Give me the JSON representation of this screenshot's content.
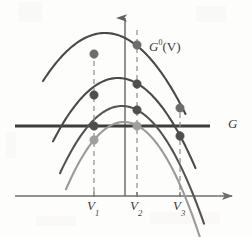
{
  "figure": {
    "background_color": "#fdfdfc",
    "width": 252,
    "height": 237
  },
  "labels": {
    "curve_family": {
      "base": "G",
      "superscript": "0",
      "argument": "(V)",
      "full_text": "G⁰(V)",
      "x": 149,
      "y": 40
    },
    "horizontal_line": {
      "text": "G",
      "x": 228,
      "y": 117
    },
    "v1": {
      "base": "V",
      "subscript": "1",
      "full_text": "V₁",
      "x": 87,
      "y": 199
    },
    "v2": {
      "base": "V",
      "subscript": "2",
      "full_text": "V₂",
      "x": 130,
      "y": 199
    },
    "v3": {
      "base": "V",
      "subscript": "3",
      "full_text": "V₃",
      "x": 173,
      "y": 199
    }
  },
  "colors": {
    "curve_dark": "#4a4a4a",
    "curve_mid": "#545454",
    "curve_light": "#9a9a9a",
    "axis": "#6e6e6e",
    "g_line": "#3d3d3d",
    "dashed": "#8d8d8d",
    "dot_dark": "#5a5a5a",
    "dot_light": "#9f9f9f",
    "text": "#3a3a3a"
  },
  "chart_data": {
    "type": "line",
    "title": "",
    "subtitle": "",
    "xlabel": "",
    "ylabel": "",
    "grid": false,
    "legend_position": "none",
    "xlim": [
      0,
      252
    ],
    "ylim": [
      237,
      0
    ],
    "axes": {
      "vertical_axis": {
        "x": 125,
        "y_top": 18,
        "y_bottom": 196,
        "arrow": "up"
      },
      "horizontal_axis": {
        "y": 196,
        "x_left": 15,
        "x_right": 232,
        "arrow": "right"
      }
    },
    "reference_line": {
      "name": "G",
      "orientation": "horizontal",
      "y": 126,
      "x_start": 15,
      "x_end": 210,
      "width": 3
    },
    "vertical_markers": [
      {
        "name": "V1",
        "x": 94,
        "y_top": 52,
        "y_bottom": 196,
        "dashed": true
      },
      {
        "name": "V2",
        "x": 137,
        "y_top": 30,
        "y_bottom": 196,
        "dashed": true
      },
      {
        "name": "V3",
        "x": 180,
        "y_top": 104,
        "y_bottom": 196,
        "dashed": true
      }
    ],
    "series": [
      {
        "name": "curve-1",
        "color": "#4a4a4a",
        "apex": [
          105,
          33
        ],
        "curvature": 0.0125,
        "x_left": 43,
        "x_right": 186,
        "width": 2.1
      },
      {
        "name": "curve-2",
        "color": "#4a4a4a",
        "apex": [
          118,
          78
        ],
        "curvature": 0.015,
        "x_left": 53,
        "x_right": 196,
        "width": 2.1
      },
      {
        "name": "curve-3",
        "color": "#545454",
        "apex": [
          122,
          106
        ],
        "curvature": 0.0175,
        "x_left": 60,
        "x_right": 204,
        "width": 2.1
      },
      {
        "name": "curve-4",
        "color": "#9a9a9a",
        "apex": [
          124,
          122
        ],
        "curvature": 0.02,
        "x_left": 66,
        "x_right": 212,
        "width": 2.1
      }
    ],
    "points": [
      {
        "name": "p-c1-v1",
        "x": 94,
        "y": 54,
        "color": "#6d6d6d",
        "r": 4.2
      },
      {
        "name": "p-c1-v2",
        "x": 137,
        "y": 45,
        "color": "#6d6d6d",
        "r": 4.2
      },
      {
        "name": "p-c2-v1",
        "x": 94,
        "y": 95,
        "color": "#4f4f4f",
        "r": 4.2
      },
      {
        "name": "p-c2-v2",
        "x": 137,
        "y": 84,
        "color": "#4f4f4f",
        "r": 4.2
      },
      {
        "name": "p-c3-v1",
        "x": 94,
        "y": 126,
        "color": "#4f4f4f",
        "r": 4.2
      },
      {
        "name": "p-c3-v2",
        "x": 137,
        "y": 110,
        "color": "#4f4f4f",
        "r": 4.2
      },
      {
        "name": "p-c4-v1",
        "x": 94,
        "y": 140,
        "color": "#9f9f9f",
        "r": 4.2
      },
      {
        "name": "p-c4-v2",
        "x": 137,
        "y": 126,
        "color": "#9f9f9f",
        "r": 4.2
      },
      {
        "name": "p-c1-v3",
        "x": 180,
        "y": 108,
        "color": "#6d6d6d",
        "r": 4.2
      },
      {
        "name": "p-c2-v3",
        "x": 180,
        "y": 136,
        "color": "#4f4f4f",
        "r": 4.2
      }
    ]
  }
}
